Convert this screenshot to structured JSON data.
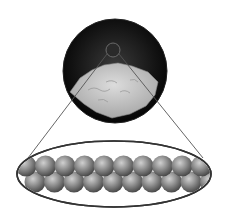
{
  "diagram": {
    "colors": {
      "background": "#ffffff",
      "lens_dark": "#151515",
      "sample": "#c9c9c9",
      "atom": "#8a8a8a",
      "atom_highlight": "#c4c4c4",
      "outline": "#3a3a3a"
    },
    "magnifier": {
      "cx": 115,
      "cy": 71,
      "r": 52
    },
    "focus_circle": {
      "cx": 113,
      "cy": 50,
      "r": 7
    },
    "lattice_ellipse": {
      "cx": 114,
      "cy": 174,
      "rx": 97,
      "ry": 33
    },
    "atoms": {
      "top_row_count": 10,
      "bottom_row_count": 10,
      "top_row_y": 166,
      "bottom_row_y": 182,
      "radius": 10.5
    }
  }
}
